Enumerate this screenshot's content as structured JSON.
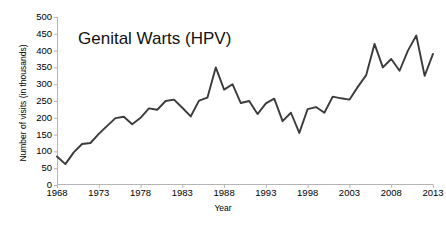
{
  "chart_data": {
    "type": "line",
    "title": "Genital Warts (HPV)",
    "xlabel": "Year",
    "ylabel": "Number of visits (in thousands)",
    "xlim": [
      1968,
      2013
    ],
    "ylim": [
      0,
      500
    ],
    "ytick_step": 50,
    "xtick_step": 5,
    "grid": false,
    "legend": null,
    "line_color": "#3b3b3b",
    "yticks": [
      500,
      450,
      400,
      350,
      300,
      250,
      200,
      150,
      100,
      50,
      0
    ],
    "xticks": [
      1968,
      1973,
      1978,
      1983,
      1988,
      1993,
      1998,
      2003,
      2008,
      2013
    ],
    "x": [
      1968,
      1969,
      1970,
      1971,
      1972,
      1973,
      1974,
      1975,
      1976,
      1977,
      1978,
      1979,
      1980,
      1981,
      1982,
      1983,
      1984,
      1985,
      1986,
      1987,
      1988,
      1989,
      1990,
      1991,
      1992,
      1993,
      1994,
      1995,
      1996,
      1997,
      1998,
      1999,
      2000,
      2001,
      2002,
      2003,
      2004,
      2005,
      2006,
      2007,
      2008,
      2009,
      2010,
      2011,
      2012,
      2013
    ],
    "values": [
      85,
      62,
      97,
      122,
      125,
      152,
      176,
      199,
      203,
      181,
      200,
      228,
      224,
      250,
      254,
      230,
      204,
      251,
      260,
      350,
      284,
      300,
      244,
      250,
      211,
      243,
      257,
      190,
      215,
      155,
      226,
      232,
      215,
      263,
      258,
      254,
      292,
      327,
      420,
      350,
      375,
      340,
      400,
      445,
      325,
      390
    ],
    "series": [
      {
        "name": "Genital Warts (HPV) visits",
        "values": [
          85,
          62,
          97,
          122,
          125,
          152,
          176,
          199,
          203,
          181,
          200,
          228,
          224,
          250,
          254,
          230,
          204,
          251,
          260,
          350,
          284,
          300,
          244,
          250,
          211,
          243,
          257,
          190,
          215,
          155,
          226,
          232,
          215,
          263,
          258,
          254,
          292,
          327,
          420,
          350,
          375,
          340,
          400,
          445,
          325,
          390
        ]
      }
    ],
    "units": "thousands of visits",
    "annotations": []
  }
}
